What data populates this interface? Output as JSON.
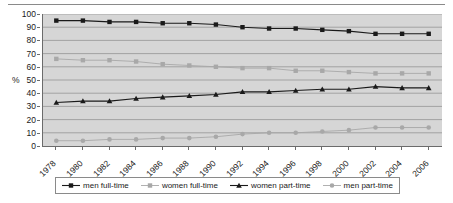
{
  "chart_data": {
    "type": "line",
    "title": "",
    "subtitle": "",
    "xlabel": "",
    "ylabel": "%",
    "ylim": [
      0,
      100
    ],
    "ytick_step": 10,
    "yticks": [
      "100",
      "90",
      "80",
      "70",
      "60",
      "50",
      "40",
      "30",
      "20",
      "10",
      "0"
    ],
    "grid": true,
    "grid_axis": "y",
    "legend_position": "bottom",
    "x": [
      1978,
      1980,
      1982,
      1984,
      1986,
      1988,
      1990,
      1992,
      1994,
      1996,
      1998,
      2000,
      2002,
      2004,
      2006
    ],
    "categories": [
      "1978",
      "1980",
      "1982",
      "1984",
      "1986",
      "1988",
      "1990",
      "1992",
      "1994",
      "1996",
      "1998",
      "2000",
      "2002",
      "2004",
      "2006"
    ],
    "series": [
      {
        "name": "men full-time",
        "color": "#1a1a1a",
        "marker": "square",
        "values": [
          95,
          95,
          94,
          94,
          93,
          93,
          92,
          90,
          89,
          89,
          88,
          87,
          85,
          85,
          85
        ]
      },
      {
        "name": "women full-time",
        "color": "#a8a8a8",
        "marker": "square",
        "values": [
          66,
          65,
          65,
          64,
          62,
          61,
          60,
          59,
          59,
          57,
          57,
          56,
          55,
          55,
          55
        ]
      },
      {
        "name": "women part-time",
        "color": "#1a1a1a",
        "marker": "triangle",
        "values": [
          33,
          34,
          34,
          36,
          37,
          38,
          39,
          41,
          41,
          42,
          43,
          43,
          45,
          44,
          44
        ]
      },
      {
        "name": "men part-time",
        "color": "#a8a8a8",
        "marker": "circle",
        "values": [
          4,
          4,
          5,
          5,
          6,
          6,
          7,
          9,
          10,
          10,
          11,
          12,
          14,
          14,
          14
        ]
      }
    ]
  },
  "colors": {
    "plot_background": "#d6d6d6",
    "page_background": "#ffffff",
    "axis": "#6b6b6b",
    "gridline": "#8c8c8c",
    "dark_series": "#1a1a1a",
    "light_series": "#a8a8a8",
    "text": "#1a1a1a",
    "rule": "#8a8a8a"
  },
  "legend": {
    "items": [
      {
        "label": "men full-time"
      },
      {
        "label": "women full-time"
      },
      {
        "label": "women part-time"
      },
      {
        "label": "men part-time"
      }
    ]
  }
}
